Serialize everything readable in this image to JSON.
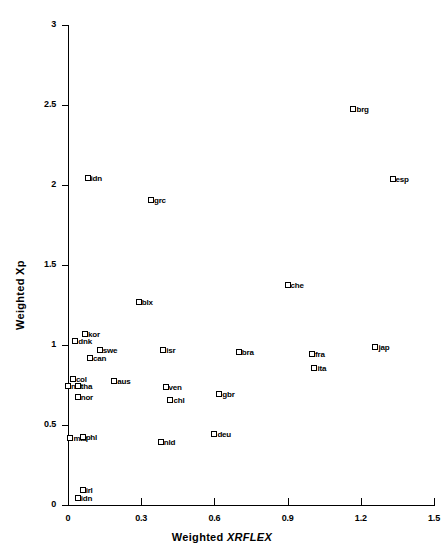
{
  "chart_data": {
    "type": "scatter",
    "title": "",
    "xlabel": "Weighted XRFLEX",
    "xlabel_plain": "Weighted ",
    "xlabel_italic": "XRFLEX",
    "ylabel": "Weighted Xp",
    "xlim": [
      0,
      1.5
    ],
    "ylim": [
      0,
      3
    ],
    "xticks": [
      "0",
      "0.3",
      "0.6",
      "0.9",
      "1.2",
      "1.5"
    ],
    "xtick_values": [
      0,
      0.3,
      0.6,
      0.9,
      1.2,
      1.5
    ],
    "yticks": [
      "0",
      "0.5",
      "1",
      "1.5",
      "2",
      "2.5",
      "3"
    ],
    "ytick_values": [
      0,
      0.5,
      1,
      1.5,
      2,
      2.5,
      3
    ],
    "grid": false,
    "legend": "none",
    "marker": "open-square",
    "points": [
      {
        "label": "brg",
        "x": 1.17,
        "y": 2.5
      },
      {
        "label": "esp",
        "x": 1.33,
        "y": 2.06
      },
      {
        "label": "idn",
        "x": 0.08,
        "y": 2.07
      },
      {
        "label": "grc",
        "x": 0.34,
        "y": 1.93
      },
      {
        "label": "che",
        "x": 0.9,
        "y": 1.4
      },
      {
        "label": "blx",
        "x": 0.29,
        "y": 1.29
      },
      {
        "label": "kor",
        "x": 0.07,
        "y": 1.09
      },
      {
        "label": "dnk",
        "x": 0.03,
        "y": 1.05
      },
      {
        "label": "jap",
        "x": 1.26,
        "y": 1.01
      },
      {
        "label": "swe",
        "x": 0.13,
        "y": 0.99
      },
      {
        "label": "isr",
        "x": 0.39,
        "y": 0.99
      },
      {
        "label": "bra",
        "x": 0.7,
        "y": 0.98
      },
      {
        "label": "fra",
        "x": 1.0,
        "y": 0.97
      },
      {
        "label": "can",
        "x": 0.09,
        "y": 0.94
      },
      {
        "label": "ita",
        "x": 1.01,
        "y": 0.88
      },
      {
        "label": "col",
        "x": 0.02,
        "y": 0.81
      },
      {
        "label": "aus",
        "x": 0.19,
        "y": 0.8
      },
      {
        "label": "nzl",
        "x": 0.0,
        "y": 0.77
      },
      {
        "label": "tha",
        "x": 0.04,
        "y": 0.77
      },
      {
        "label": "ven",
        "x": 0.4,
        "y": 0.76
      },
      {
        "label": "gbr",
        "x": 0.62,
        "y": 0.72
      },
      {
        "label": "nor",
        "x": 0.04,
        "y": 0.7
      },
      {
        "label": "chl",
        "x": 0.42,
        "y": 0.68
      },
      {
        "label": "deu",
        "x": 0.6,
        "y": 0.47
      },
      {
        "label": "mar",
        "x": 0.01,
        "y": 0.44
      },
      {
        "label": "phl",
        "x": 0.06,
        "y": 0.45
      },
      {
        "label": "nld",
        "x": 0.38,
        "y": 0.42
      },
      {
        "label": "irl",
        "x": 0.06,
        "y": 0.12
      },
      {
        "label": "idn2",
        "x": 0.04,
        "y": 0.07
      }
    ]
  },
  "caption": {
    "text": ""
  }
}
